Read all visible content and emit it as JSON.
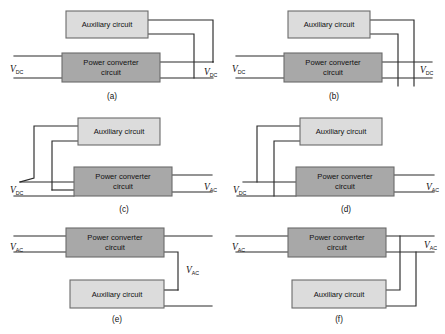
{
  "figure": {
    "labels": {
      "auxiliary": "Auxiliary circuit",
      "power_converter_line1": "Power converter",
      "power_converter_line2": "circuit"
    },
    "symbols": {
      "v": "V",
      "dc": "DC",
      "ac": "AC"
    },
    "colors": {
      "auxiliary_fill": "#dcdcdc",
      "converter_fill": "#a8a8a8",
      "box_stroke": "#6b6b6b",
      "wire": "#2b2b2b",
      "background": "#ffffff"
    },
    "panels": [
      {
        "id": "a",
        "caption": "(a)",
        "input_label": "V",
        "input_sub": "DC",
        "output_label": "V",
        "output_sub": "DC",
        "top_block": "Auxiliary circuit",
        "bottom_block": "Power converter circuit",
        "description": "Auxiliary circuit above power converter; both auxiliary leads route right and tie into the DC output rails"
      },
      {
        "id": "b",
        "caption": "(b)",
        "input_label": "V",
        "input_sub": "DC",
        "output_label": "V",
        "output_sub": "DC",
        "top_block": "Auxiliary circuit",
        "bottom_block": "Power converter circuit",
        "description": "Auxiliary circuit above power converter; auxiliary leads route right and drop down across the converter output rails"
      },
      {
        "id": "c",
        "caption": "(c)",
        "input_label": "V",
        "input_sub": "DC",
        "output_label": "V",
        "output_sub": "AC",
        "top_block": "Auxiliary circuit",
        "bottom_block": "Power converter circuit",
        "description": "Auxiliary leads route left and join the upper DC input rail; converter delivers AC output"
      },
      {
        "id": "d",
        "caption": "(d)",
        "input_label": "V",
        "input_sub": "DC",
        "output_label": "V",
        "output_sub": "AC",
        "top_block": "Auxiliary circuit",
        "bottom_block": "Power converter circuit",
        "description": "Auxiliary leads route left, one to the upper DC rail and one down to the lower DC rail; converter delivers AC output"
      },
      {
        "id": "e",
        "caption": "(e)",
        "input_label": "V",
        "input_sub": "AC",
        "output_label": "V",
        "output_sub": "AC",
        "top_block": "Power converter circuit",
        "bottom_block": "Auxiliary circuit",
        "description": "Power converter on top with AC input; auxiliary circuit below, outputs stacked with the AC label between them"
      },
      {
        "id": "f",
        "caption": "(f)",
        "input_label": "V",
        "input_sub": "AC",
        "output_label": "V",
        "output_sub": "AC",
        "top_block": "Power converter circuit",
        "bottom_block": "Auxiliary circuit",
        "description": "Power converter on top with AC input; auxiliary outputs route right and merge into the common AC output rails"
      }
    ]
  }
}
